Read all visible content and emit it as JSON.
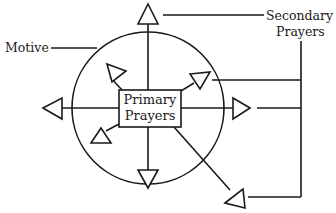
{
  "diagram": {
    "type": "concept-diagram",
    "labels": {
      "motive": "Motive",
      "secondary_line1": "Secondary",
      "secondary_line2": "Prayers",
      "primary_line1": "Primary",
      "primary_line2": "Prayers"
    },
    "nodes": [
      {
        "id": "motive",
        "shape": "circle",
        "label": "Motive"
      },
      {
        "id": "primary",
        "shape": "rectangle",
        "label": "Primary Prayers"
      },
      {
        "id": "secondary",
        "shape": "label",
        "label": "Secondary Prayers"
      }
    ],
    "arrows_outward_from_primary": [
      {
        "direction": "up",
        "crosses_circle": true
      },
      {
        "direction": "down",
        "crosses_circle": false
      },
      {
        "direction": "left",
        "crosses_circle": true
      },
      {
        "direction": "right",
        "crosses_circle": true
      },
      {
        "direction": "up-left",
        "crosses_circle": false
      },
      {
        "direction": "up-right",
        "crosses_circle": false
      },
      {
        "direction": "down-left",
        "crosses_circle": false
      },
      {
        "direction": "down-right",
        "crosses_circle": true
      }
    ],
    "colors": {
      "stroke": "#1a1a1a",
      "background": "#ffffff"
    }
  }
}
